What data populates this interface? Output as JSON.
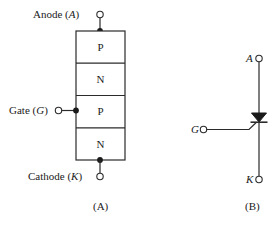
{
  "figure": {
    "stroke_color": "#2b2b2b",
    "fill_color": "#ffffff",
    "background": "#ffffff"
  },
  "panel_a": {
    "caption": "(A)",
    "anode": {
      "label_text": "Anode (",
      "label_symbol": "A",
      "label_close": ")"
    },
    "gate": {
      "label_text": "Gate (",
      "label_symbol": "G",
      "label_close": ")"
    },
    "cathode": {
      "label_text": "Cathode (",
      "label_symbol": "K",
      "label_close": ")"
    },
    "layers": [
      {
        "label": "P"
      },
      {
        "label": "N"
      },
      {
        "label": "P"
      },
      {
        "label": "N"
      }
    ]
  },
  "panel_b": {
    "caption": "(B)",
    "anode_label": "A",
    "gate_label": "G",
    "cathode_label": "K"
  }
}
